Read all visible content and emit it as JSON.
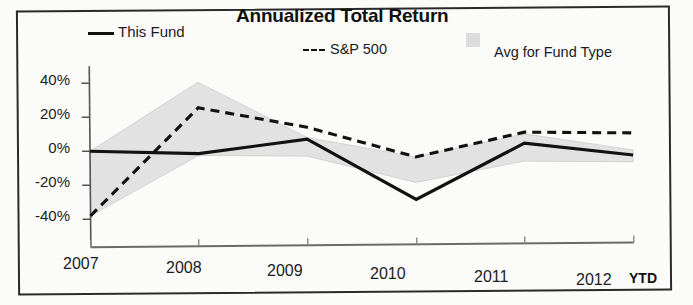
{
  "title": "Annualized Total Return",
  "legend": [
    {
      "name": "this-fund",
      "label": "This Fund",
      "marker": "solid-line",
      "color": "#111111"
    },
    {
      "name": "sp-500",
      "label": "S&P 500",
      "marker": "dashed-line",
      "color": "#111111"
    },
    {
      "name": "avg-fund-type",
      "label": "Avg for Fund Type",
      "marker": "filled-square",
      "color": "#dcdcdc"
    }
  ],
  "axis": {
    "y_ticks": [
      "40%",
      "20%",
      "0%",
      "-20%",
      "-40%"
    ],
    "x_ticks": [
      "2007",
      "2008",
      "2009",
      "2010",
      "2011",
      "2012"
    ],
    "x_suffix": "YTD"
  },
  "chart_data": {
    "type": "line",
    "title": "Annualized Total Return",
    "xlabel": "",
    "ylabel": "",
    "x": [
      "2007",
      "2008",
      "2009",
      "2010",
      "2011",
      "2012"
    ],
    "ylim": [
      -50,
      50
    ],
    "ytick_values": [
      40,
      20,
      0,
      -20,
      -40
    ],
    "grid": false,
    "legend_position": "top",
    "series": [
      {
        "name": "This Fund",
        "style": "solid",
        "color": "#111111",
        "values": [
          0,
          -2,
          6,
          -30,
          2.5,
          -5
        ]
      },
      {
        "name": "S&P 500",
        "style": "dashed",
        "color": "#111111",
        "values": [
          -38,
          25,
          13,
          -5,
          9,
          8
        ]
      },
      {
        "name": "Avg for Fund Type",
        "style": "band",
        "color": "#dcdcdc",
        "upper": [
          0,
          40,
          7,
          -5,
          8,
          -2
        ],
        "lower": [
          -38,
          -3,
          -4,
          -20,
          -8,
          -9
        ]
      }
    ]
  }
}
